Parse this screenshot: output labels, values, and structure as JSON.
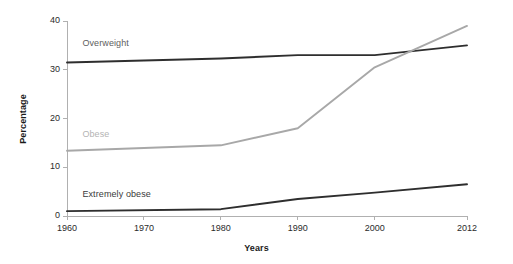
{
  "chart_data": {
    "type": "line",
    "title": "",
    "xlabel": "Years",
    "ylabel": "Percentage",
    "xlim": [
      1960,
      2012
    ],
    "ylim": [
      0,
      40
    ],
    "grid": false,
    "legend_position": "inline-series-labels",
    "xticks": [
      "1960",
      "1970",
      "1980",
      "1990",
      "2000",
      "2012"
    ],
    "xtick_values": [
      1960,
      1970,
      1980,
      1990,
      2000,
      2012
    ],
    "yticks": [
      "0",
      "10",
      "20",
      "30",
      "40"
    ],
    "ytick_values": [
      0,
      10,
      20,
      30,
      40
    ],
    "x": [
      1960,
      1980,
      1990,
      2000,
      2012
    ],
    "series": [
      {
        "name": "Overweight",
        "color": "#2e2e2e",
        "label_color": "#5e5e5e",
        "values": [
          31.5,
          32.3,
          33.0,
          33.0,
          35.0
        ]
      },
      {
        "name": "Obese",
        "color": "#a8a8a8",
        "label_color": "#b4b4b4",
        "values": [
          13.4,
          14.5,
          18.0,
          30.5,
          39.0
        ]
      },
      {
        "name": "Extremely obese",
        "color": "#2e2e2e",
        "label_color": "#3a3a3a",
        "values": [
          1.0,
          1.4,
          3.5,
          4.8,
          6.5
        ]
      }
    ],
    "annotations": [
      {
        "text": "Overweight",
        "x": 1962,
        "y": 35.2
      },
      {
        "text": "Obese",
        "x": 1962,
        "y": 16.6
      },
      {
        "text": "Extremely obese",
        "x": 1962,
        "y": 4.4
      }
    ],
    "axis_color": "#b0b0b0",
    "background": "#ffffff"
  }
}
